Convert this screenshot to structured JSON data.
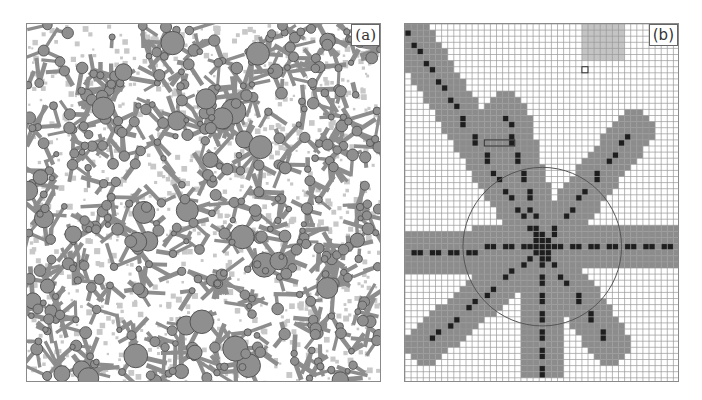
{
  "figure": {
    "panel_a": {
      "label": "(a)",
      "description": "Random field of circular particles of varying size connected by gray branching channels"
    },
    "panel_b": {
      "label": "(b)",
      "description": "Square lattice grid with an eight-armed star of shaded cells, dark centerline cells, and a circle centered on the star",
      "grid": {
        "cols": 45,
        "rows": 58,
        "cell_px": 6.1
      },
      "center_cell": [
        22,
        36
      ],
      "circle_radius_cells": 13,
      "arms": [
        {
          "from": [
            22,
            36
          ],
          "to": [
            0,
            1
          ]
        },
        {
          "from": [
            22,
            36
          ],
          "to": [
            16,
            14
          ]
        },
        {
          "from": [
            22,
            36
          ],
          "to": [
            37,
            17
          ]
        },
        {
          "from": [
            22,
            36
          ],
          "to": [
            44,
            36
          ]
        },
        {
          "from": [
            22,
            36
          ],
          "to": [
            33,
            52
          ]
        },
        {
          "from": [
            22,
            36
          ],
          "to": [
            22,
            58
          ]
        },
        {
          "from": [
            22,
            36
          ],
          "to": [
            3,
            52
          ]
        },
        {
          "from": [
            22,
            36
          ],
          "to": [
            1,
            37
          ]
        }
      ],
      "colors": {
        "grid_line": "#9a9a9a",
        "arm_fill": "#8c8c8c",
        "centerline": "#1e1e1e",
        "highlight_patch": "#c4c4c4",
        "circle": "#555555"
      }
    },
    "colors": {
      "particle_fill": "#8f8f8f",
      "particle_edge": "#555555",
      "channel": "#8d8d8d",
      "speckle": "#c8c8c8"
    }
  }
}
